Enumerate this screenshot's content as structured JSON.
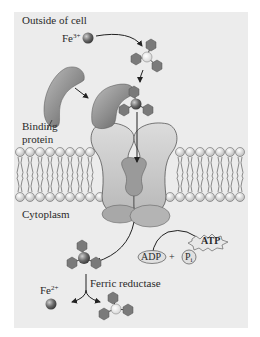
{
  "figure": {
    "regions": {
      "outside": "Outside of cell",
      "inside": "Cytoplasm"
    },
    "labels": {
      "fe3": "Fe",
      "fe3_charge": "3+",
      "fe2": "Fe",
      "fe2_charge": "2+",
      "binding_protein_line1": "Binding",
      "binding_protein_line2": "protein",
      "ferric_reductase": "Ferric reductase",
      "atp": "ATP",
      "adp": "ADP",
      "plus": "+",
      "pi": "P",
      "pi_sub": "i"
    },
    "colors": {
      "panel_bg": "#ececec",
      "protein_dark": "#6e6e6e",
      "protein_mid": "#9a9a9a",
      "protein_light": "#cfcfcf",
      "siderophore_hex": "#7a7a7a",
      "iron_ball": "#5a5a5a",
      "membrane_head": "#e8e8e8",
      "outline": "#3a3a3a"
    }
  }
}
